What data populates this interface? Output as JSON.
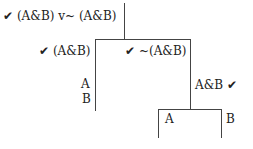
{
  "tree": {
    "root": {
      "check": "✔",
      "formula": "(A&B) v~ (A&B)"
    },
    "left": {
      "check": "✔",
      "formula": "(A&B)",
      "children": [
        "A",
        "B"
      ]
    },
    "right": {
      "check": "✔",
      "formula": "~(A&B)",
      "child": {
        "formula": "A&B",
        "check": "✔",
        "branches": [
          "A",
          "B"
        ]
      }
    }
  }
}
